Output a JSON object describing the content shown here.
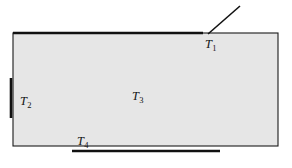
{
  "figure": {
    "background_color": "#ffffff",
    "body": {
      "name": "rectangular-region",
      "fill_color": "#e6e6e6",
      "stroke_color": "#1a1a1a",
      "x": 13,
      "y": 33,
      "width": 265,
      "height": 113
    },
    "labels": [
      {
        "id": "T1",
        "symbol": "T",
        "subscript": "1",
        "position": "top-edge",
        "x": 205,
        "y": 38
      },
      {
        "id": "T2",
        "symbol": "T",
        "subscript": "2",
        "position": "left-edge",
        "x": 20,
        "y": 95
      },
      {
        "id": "T3",
        "symbol": "T",
        "subscript": "3",
        "position": "interior",
        "x": 132,
        "y": 90
      },
      {
        "id": "T4",
        "symbol": "T",
        "subscript": "4",
        "position": "bottom-edge",
        "x": 77,
        "y": 135
      }
    ],
    "emphasis_segments": [
      {
        "id": "top-surface-segment",
        "label_ref": "T1",
        "orientation": "horizontal",
        "x1": 13,
        "y1": 33,
        "x2": 203,
        "y2": 33,
        "stroke_width": 2.6,
        "color": "#111111"
      },
      {
        "id": "left-surface-segment",
        "label_ref": "T2",
        "orientation": "vertical",
        "x1": 11,
        "y1": 78,
        "x2": 11,
        "y2": 118,
        "stroke_width": 2.6,
        "color": "#111111"
      },
      {
        "id": "bottom-surface-segment",
        "label_ref": "T4",
        "orientation": "horizontal",
        "x1": 72,
        "y1": 151,
        "x2": 220,
        "y2": 151,
        "stroke_width": 2.4,
        "color": "#111111"
      }
    ],
    "leader_line": {
      "id": "T1-leader-line",
      "x1": 240,
      "y1": 6,
      "x2": 208,
      "y2": 34,
      "stroke_width": 1.6,
      "color": "#111111"
    }
  }
}
